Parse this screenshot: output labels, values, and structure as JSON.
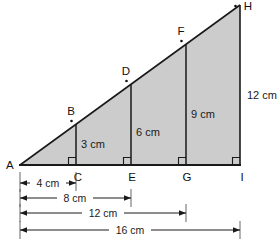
{
  "figure": {
    "fill_color": "#cccccc",
    "stroke_color": "#1a1a1a",
    "background_color": "#ffffff",
    "vertices": {
      "A": "A",
      "B": "B",
      "C": "C",
      "D": "D",
      "E": "E",
      "F": "F",
      "G": "G",
      "H": "H",
      "I": "I"
    },
    "vertical_segments": [
      {
        "name": "CB",
        "label": "3 cm",
        "base_point": "C",
        "top_point": "B",
        "value": 3,
        "unit": "cm"
      },
      {
        "name": "ED",
        "label": "6 cm",
        "base_point": "E",
        "top_point": "D",
        "value": 6,
        "unit": "cm"
      },
      {
        "name": "GF",
        "label": "9 cm",
        "base_point": "G",
        "top_point": "F",
        "value": 9,
        "unit": "cm"
      },
      {
        "name": "IH",
        "label": "12 cm",
        "base_point": "I",
        "top_point": "H",
        "value": 12,
        "unit": "cm"
      }
    ],
    "base_dimensions": [
      {
        "name": "AC",
        "label": "4 cm",
        "from": "A",
        "to": "C",
        "value": 4,
        "unit": "cm"
      },
      {
        "name": "AE",
        "label": "8 cm",
        "from": "A",
        "to": "E",
        "value": 8,
        "unit": "cm"
      },
      {
        "name": "AG",
        "label": "12 cm",
        "from": "A",
        "to": "G",
        "value": 12,
        "unit": "cm"
      },
      {
        "name": "AI",
        "label": "16 cm",
        "from": "A",
        "to": "I",
        "value": 16,
        "unit": "cm"
      }
    ],
    "right_angle_marks": 4,
    "angle_dots": 4
  }
}
